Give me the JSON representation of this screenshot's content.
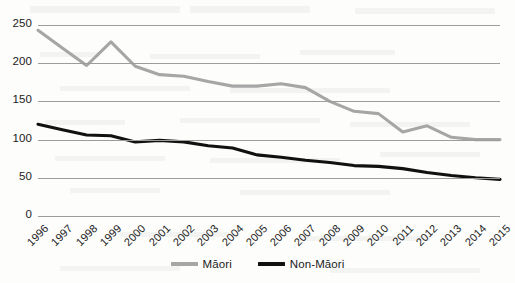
{
  "chart_data": {
    "type": "line",
    "title": "",
    "subtitle": "",
    "xlabel": "",
    "ylabel": "",
    "categories": [
      "1996",
      "1997",
      "1998",
      "1999",
      "2000",
      "2001",
      "2002",
      "2003",
      "2004",
      "2005",
      "2006",
      "2007",
      "2008",
      "2009",
      "2010",
      "2011",
      "2012",
      "2013",
      "2014",
      "2015"
    ],
    "series": [
      {
        "name": "Māori",
        "color": "#a6a6a6",
        "values": [
          243,
          220,
          197,
          228,
          196,
          185,
          183,
          176,
          170,
          170,
          173,
          168,
          150,
          137,
          134,
          110,
          118,
          103,
          100,
          100
        ]
      },
      {
        "name": "Non-Māori",
        "color": "#111111",
        "values": [
          120,
          113,
          106,
          105,
          97,
          99,
          97,
          92,
          89,
          80,
          77,
          73,
          70,
          66,
          65,
          62,
          57,
          53,
          50,
          48
        ]
      }
    ],
    "ylim": [
      0,
      250
    ],
    "yticks": [
      0,
      50,
      100,
      150,
      200,
      250
    ],
    "ytick_labels": [
      "0",
      "50",
      "100",
      "150",
      "200",
      "250"
    ],
    "grid": true,
    "grid_axis": "y",
    "grid_color": "#9c9c9c",
    "legend_position": "bottom",
    "xtick_rotation": -45
  }
}
